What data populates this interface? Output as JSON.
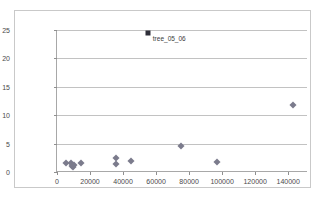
{
  "chart_data": {
    "type": "scatter",
    "title": "",
    "xlabel": "",
    "ylabel": "",
    "xlim": [
      0,
      152000
    ],
    "ylim": [
      0,
      25
    ],
    "grid": "horizontal",
    "legend": "none",
    "xticks": [
      "0",
      "20000",
      "40000",
      "60000",
      "80000",
      "100000",
      "120000",
      "140000"
    ],
    "xtick_values": [
      0,
      20000,
      40000,
      60000,
      80000,
      100000,
      120000,
      140000
    ],
    "yticks": [
      "0",
      "5",
      "10",
      "15",
      "20",
      "25"
    ],
    "ytick_values": [
      0,
      5,
      10,
      15,
      20,
      25
    ],
    "series": [
      {
        "name": "points",
        "marker": "diamond",
        "color": "#7b7b8c",
        "points": [
          {
            "x": 5500,
            "y": 1.5
          },
          {
            "x": 8500,
            "y": 1.6
          },
          {
            "x": 9000,
            "y": 1.0
          },
          {
            "x": 9500,
            "y": 0.8
          },
          {
            "x": 10000,
            "y": 1.3
          },
          {
            "x": 14500,
            "y": 1.6
          },
          {
            "x": 35500,
            "y": 1.4
          },
          {
            "x": 36000,
            "y": 2.5
          },
          {
            "x": 45000,
            "y": 2.0
          },
          {
            "x": 75000,
            "y": 4.5
          },
          {
            "x": 97000,
            "y": 1.8
          },
          {
            "x": 143000,
            "y": 11.8
          }
        ]
      },
      {
        "name": "highlighted",
        "marker": "square",
        "color": "#2e2e38",
        "points": [
          {
            "x": 55000,
            "y": 24.5,
            "label": "tree_05_06"
          }
        ]
      }
    ]
  }
}
